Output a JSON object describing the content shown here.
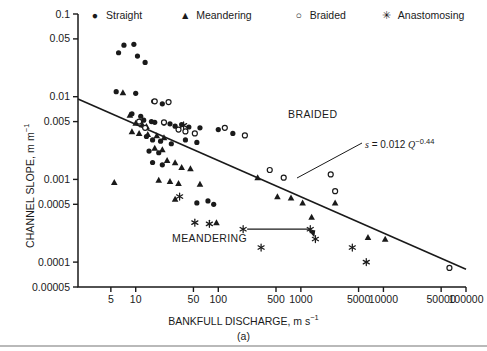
{
  "figure": {
    "panel_label": "(a)",
    "background_color": "#ffffff",
    "ink_color": "#1a1a1a"
  },
  "legend": {
    "position": "top",
    "items": [
      {
        "label": "Straight",
        "symbol": "filled-circle",
        "glyph": "●"
      },
      {
        "label": "Meandering",
        "symbol": "filled-triangle",
        "glyph": "▲"
      },
      {
        "label": "Braided",
        "symbol": "open-circle",
        "glyph": "○"
      },
      {
        "label": "Anastomosing",
        "symbol": "asterisk",
        "glyph": "✳"
      }
    ]
  },
  "axes": {
    "x": {
      "label_main": "BANKFULL DISCHARGE, m s",
      "label_exponent": "−1",
      "scale": "log",
      "min": 2,
      "max": 100000,
      "ticks": [
        5,
        10,
        50,
        100,
        500,
        1000,
        5000,
        10000,
        50000,
        100000
      ],
      "tick_labels": [
        "5",
        "10",
        "50",
        "100",
        "500",
        "1000",
        "5000",
        "10000",
        "50000",
        "100000"
      ]
    },
    "y": {
      "label_main": "CHANNEL SLOPE, m m",
      "label_exponent": "−1",
      "scale": "log",
      "min": 5e-05,
      "max": 0.1,
      "ticks": [
        0.1,
        0.05,
        0.01,
        0.005,
        0.001,
        0.0005,
        0.0001,
        5e-05
      ],
      "tick_labels": [
        "0.1",
        "0.05",
        "0.01",
        "0.005",
        "0.001",
        "0.0005",
        "0.0001",
        "0.00005"
      ]
    }
  },
  "annotations": {
    "braided_label": "BRAIDED",
    "meandering_label": "MEANDERING",
    "equation_prefix": "s",
    "equation_text": " = 0.012 ",
    "equation_var": "Q",
    "equation_exponent": "−0.44"
  },
  "chart_data": {
    "type": "scatter",
    "title": "",
    "xlabel": "BANKFULL DISCHARGE, m s−1",
    "ylabel": "CHANNEL SLOPE, m m−1",
    "xscale": "log",
    "yscale": "log",
    "xlim": [
      2,
      100000
    ],
    "ylim": [
      5e-05,
      0.1
    ],
    "grid": false,
    "legend_position": "top",
    "trendline": {
      "label": "s = 0.012 Q^-0.44",
      "coefficient": 0.012,
      "exponent": -0.44,
      "x_start": 2,
      "x_end": 100000,
      "y_start": 0.0094,
      "y_end": 8.2e-05
    },
    "annotation_arrow": {
      "description": "horizontal connector between two anastomosing points",
      "x_start": 200,
      "x_end": 1300,
      "y": 0.00025
    },
    "series": [
      {
        "name": "Straight",
        "symbol": "filled-circle",
        "points": [
          [
            7.2,
            0.042
          ],
          [
            9.5,
            0.043
          ],
          [
            6.2,
            0.034
          ],
          [
            10.5,
            0.031
          ],
          [
            13.0,
            0.026
          ],
          [
            5.8,
            0.0115
          ],
          [
            10.0,
            0.011
          ],
          [
            16.5,
            0.0088
          ],
          [
            21.0,
            0.0082
          ],
          [
            9.0,
            0.0062
          ],
          [
            11.5,
            0.0058
          ],
          [
            12.5,
            0.0052
          ],
          [
            15.5,
            0.005
          ],
          [
            17.0,
            0.0049
          ],
          [
            22.0,
            0.0048
          ],
          [
            26.0,
            0.0047
          ],
          [
            30.0,
            0.0044
          ],
          [
            36.0,
            0.0046
          ],
          [
            44.0,
            0.0043
          ],
          [
            60.0,
            0.0042
          ],
          [
            100.0,
            0.004
          ],
          [
            150.0,
            0.0036
          ],
          [
            13.5,
            0.0033
          ],
          [
            16.0,
            0.003
          ],
          [
            20.0,
            0.0029
          ],
          [
            27.0,
            0.0027
          ],
          [
            40.0,
            0.003
          ],
          [
            55.0,
            0.0028
          ],
          [
            14.5,
            0.0022
          ],
          [
            19.0,
            0.0021
          ],
          [
            16.0,
            0.0016
          ],
          [
            21.0,
            0.0015
          ],
          [
            55.0,
            0.00052
          ],
          [
            75.0,
            0.00055
          ],
          [
            88.0,
            0.0005
          ]
        ]
      },
      {
        "name": "Meandering",
        "symbol": "filled-triangle",
        "points": [
          [
            7.0,
            0.0112
          ],
          [
            8.5,
            0.006
          ],
          [
            10.0,
            0.0048
          ],
          [
            12.0,
            0.0046
          ],
          [
            13.5,
            0.0044
          ],
          [
            9.0,
            0.0038
          ],
          [
            11.0,
            0.0036
          ],
          [
            14.0,
            0.0035
          ],
          [
            18.0,
            0.0034
          ],
          [
            22.0,
            0.0032
          ],
          [
            17.0,
            0.0024
          ],
          [
            21.0,
            0.0023
          ],
          [
            24.0,
            0.0017
          ],
          [
            30.0,
            0.0016
          ],
          [
            36.0,
            0.0014
          ],
          [
            46.0,
            0.00135
          ],
          [
            5.5,
            0.00092
          ],
          [
            19.0,
            0.00098
          ],
          [
            26.0,
            0.00095
          ],
          [
            33.0,
            0.0009
          ],
          [
            60.0,
            0.00088
          ],
          [
            30.0,
            0.00058
          ],
          [
            300.0,
            0.00105
          ],
          [
            520.0,
            0.00062
          ],
          [
            760.0,
            0.0006
          ],
          [
            1050.0,
            0.00052
          ],
          [
            1350.0,
            0.00035
          ],
          [
            2600.0,
            0.00052
          ],
          [
            95.0,
            0.0003
          ],
          [
            6500.0,
            0.0002
          ],
          [
            10500.0,
            0.00019
          ]
        ]
      },
      {
        "name": "Braided",
        "symbol": "open-circle",
        "points": [
          [
            17.0,
            0.0088
          ],
          [
            25.0,
            0.0086
          ],
          [
            11.0,
            0.005
          ],
          [
            22.0,
            0.0049
          ],
          [
            13.0,
            0.0042
          ],
          [
            33.0,
            0.004
          ],
          [
            40.0,
            0.0038
          ],
          [
            52.0,
            0.0036
          ],
          [
            120.0,
            0.0042
          ],
          [
            210.0,
            0.0034
          ],
          [
            420.0,
            0.0013
          ],
          [
            620.0,
            0.00105
          ],
          [
            2300.0,
            0.00115
          ],
          [
            2600.0,
            0.00072
          ],
          [
            63000.0,
            8.5e-05
          ]
        ]
      },
      {
        "name": "Anastomosing",
        "symbol": "asterisk",
        "points": [
          [
            38.0,
            0.0045
          ],
          [
            34.0,
            0.00062
          ],
          [
            52.0,
            0.0003
          ],
          [
            78.0,
            0.00029
          ],
          [
            200.0,
            0.00025
          ],
          [
            1300.0,
            0.00025
          ],
          [
            1500.0,
            0.00019
          ],
          [
            330.0,
            0.00015
          ],
          [
            4200.0,
            0.00015
          ],
          [
            6200.0,
            0.0001
          ]
        ]
      }
    ]
  }
}
